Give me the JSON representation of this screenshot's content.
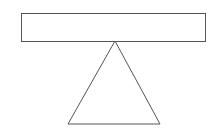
{
  "diagram": {
    "background": "#ffffff",
    "stroke_color": "#555555",
    "stroke_width": 1,
    "shapes": [
      {
        "type": "rectangle",
        "name": "beam",
        "x": 21,
        "y": 13,
        "width": 184,
        "height": 28
      },
      {
        "type": "triangle",
        "name": "fulcrum",
        "points": [
          [
            115,
            41
          ],
          [
            68,
            124
          ],
          [
            160,
            124
          ]
        ]
      }
    ]
  }
}
